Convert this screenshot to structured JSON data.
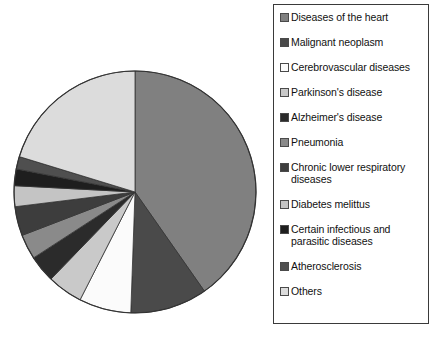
{
  "chart_data": {
    "type": "pie",
    "title": "",
    "legend_position": "right",
    "labels": [
      "Diseases of the heart",
      "Malignant neoplasm",
      "Cerebrovascular diseases",
      "Parkinson's disease",
      "Alzheimer's disease",
      "Pneumonia",
      "Chronic lower respiratory diseases",
      "Diabetes melittus",
      "Certain infectious and parasitic diseases",
      "Atherosclerosis",
      "Others"
    ],
    "values": [
      40.3,
      10.3,
      6.9,
      4.7,
      3.6,
      3.3,
      3.9,
      2.8,
      2.2,
      1.7,
      20.3
    ],
    "angles_deg": [
      145,
      37,
      25,
      17,
      13,
      12,
      14,
      10,
      8,
      6,
      73
    ],
    "colors": [
      "#808080",
      "#4a4a4a",
      "#fbfbfb",
      "#c9c9c9",
      "#2b2b2b",
      "#8a8a8a",
      "#3d3d3d",
      "#c4c4c4",
      "#1e1e1e",
      "#4f4f4f",
      "#dcdcdc"
    ],
    "start_angle_deg": 0,
    "direction": "clockwise",
    "stroke_color": "#333333"
  },
  "legend": {
    "items": [
      {
        "label": "Diseases of the heart",
        "color": "#808080"
      },
      {
        "label": "Malignant neoplasm",
        "color": "#4a4a4a"
      },
      {
        "label": "Cerebrovascular diseases",
        "color": "#fbfbfb"
      },
      {
        "label": "Parkinson's disease",
        "color": "#c9c9c9"
      },
      {
        "label": "Alzheimer's disease",
        "color": "#2b2b2b"
      },
      {
        "label": "Pneumonia",
        "color": "#8a8a8a"
      },
      {
        "label": "Chronic lower respiratory\ndiseases",
        "color": "#3d3d3d"
      },
      {
        "label": "Diabetes melittus",
        "color": "#c4c4c4"
      },
      {
        "label": "Certain infectious and\nparasitic diseases",
        "color": "#1e1e1e"
      },
      {
        "label": "Atherosclerosis",
        "color": "#4f4f4f"
      },
      {
        "label": "Others",
        "color": "#dcdcdc"
      }
    ]
  }
}
